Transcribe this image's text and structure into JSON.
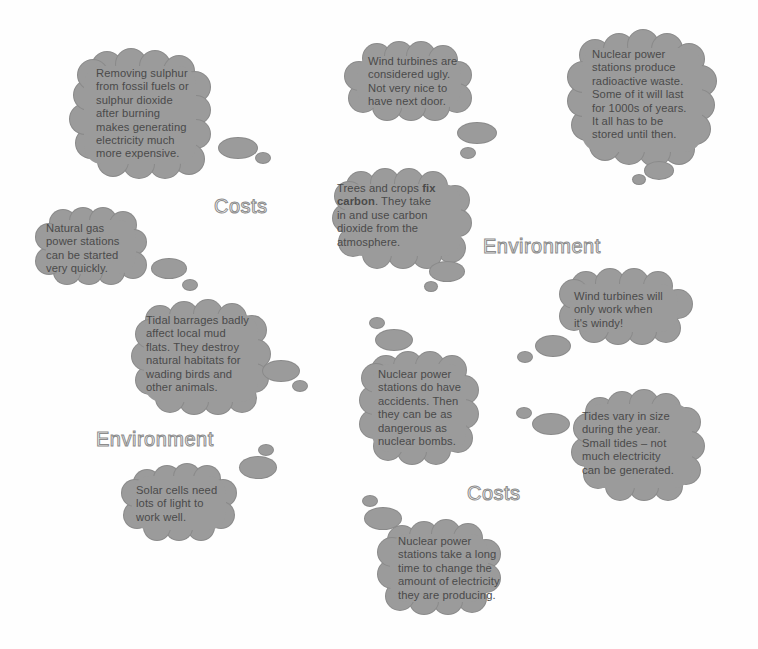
{
  "colors": {
    "bubble_fill": "#9b9b9b",
    "bubble_text": "#4a4a4a",
    "heading_fill": "#ffffff",
    "heading_outline": "#8c8c8c",
    "background": "#fefefe"
  },
  "headings": [
    {
      "label": "Costs"
    },
    {
      "label": "Environment"
    },
    {
      "label": "Environment"
    },
    {
      "label": "Costs"
    }
  ],
  "bubbles": [
    {
      "id": "sulphur",
      "text": "Removing sulphur\nfrom fossil fuels or\nsulphur dioxide\nafter burning\nmakes generating\nelectricity much\nmore expensive."
    },
    {
      "id": "wind-ugly",
      "text": "Wind turbines are\nconsidered ugly.\nNot very nice to\nhave next door."
    },
    {
      "id": "nuclear-waste",
      "text": "Nuclear power\nstations produce\nradioactive waste.\nSome of it will last\nfor 1000s of years.\nIt all has to be\nstored until then."
    },
    {
      "id": "natural-gas",
      "text": "Natural gas\npower stations\ncan be started\nvery quickly."
    },
    {
      "id": "trees",
      "text_before": "Trees and crops ",
      "text_bold": "fix\ncarbon",
      "text_after": ". They take\nin and use carbon\ndioxide from the\natmosphere."
    },
    {
      "id": "wind-windy",
      "text": "Wind turbines will\nonly work when\nit's windy!"
    },
    {
      "id": "tidal-barrages",
      "text": "Tidal barrages badly\naffect local mud\nflats. They destroy\nnatural habitats for\nwading birds and\nother animals."
    },
    {
      "id": "nuclear-accidents",
      "text": "Nuclear power\nstations do have\naccidents. Then\nthey can be as\ndangerous as\nnuclear bombs."
    },
    {
      "id": "tides-vary",
      "text": "Tides vary in size\nduring the year.\nSmall tides – not\nmuch electricity\ncan be generated."
    },
    {
      "id": "solar",
      "text": "Solar cells need\nlots of light to\nwork well."
    },
    {
      "id": "nuclear-slow",
      "text": "Nuclear power\nstations take a long\ntime to change the\namount of electricity\nthey are producing."
    }
  ]
}
